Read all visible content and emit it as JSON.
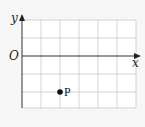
{
  "diagram": {
    "type": "coordinate-grid",
    "axes": {
      "x_label": "x",
      "y_label": "y",
      "origin_label": "O"
    },
    "grid": {
      "columns": 6,
      "rows": 5,
      "rows_above_x_axis": 2,
      "rows_below_x_axis": 3,
      "line_color": "#c8c8c8",
      "axis_color": "#333333"
    },
    "points": [
      {
        "label": "P",
        "x": 2,
        "y": -2,
        "color": "#111111"
      }
    ]
  }
}
